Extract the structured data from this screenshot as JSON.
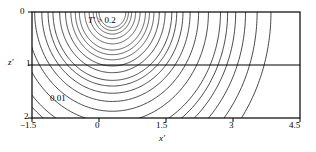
{
  "figure": {
    "kind": "contour-plot",
    "background": "#ffffff",
    "line_color": "#1a1a1a",
    "frame_color": "#000000"
  },
  "chart_data": {
    "type": "line",
    "title": "",
    "subtitle": "",
    "xlabel": "x'",
    "ylabel": "z'",
    "xlim": [
      -1.5,
      4.5
    ],
    "ylim": [
      0,
      2
    ],
    "y_axis_inverted": true,
    "grid": false,
    "legend": "none",
    "x_ticks": [
      -1.5,
      0,
      1.5,
      3,
      4.5
    ],
    "x_tick_labels": [
      "−1.5",
      "0",
      "1.5",
      "3",
      "4.5"
    ],
    "y_ticks": [
      0,
      1,
      2
    ],
    "y_tick_labels": [
      "0",
      "1",
      "2"
    ],
    "source_point": {
      "x": 0.3,
      "z": 0.0
    },
    "reference_line": {
      "orientation": "horizontal",
      "z": 1.0,
      "label": "z' = 1"
    },
    "contour_variable": "T'",
    "contour_levels": [
      0.2,
      0.18,
      0.16,
      0.14,
      0.12,
      0.1,
      0.09,
      0.08,
      0.07,
      0.06,
      0.05,
      0.045,
      0.04,
      0.035,
      0.03,
      0.025,
      0.02,
      0.018,
      0.016,
      0.014,
      0.012,
      0.01
    ],
    "labeled_contours": [
      {
        "level": 0.2,
        "label": "T' > 0.2",
        "note": "innermost white core region"
      },
      {
        "level": 0.01,
        "label": "0.01",
        "note": "outermost contour"
      }
    ],
    "contour_radii_x": [
      0.3,
      0.36,
      0.43,
      0.52,
      0.62,
      0.74,
      0.83,
      0.93,
      1.05,
      1.18,
      1.33,
      1.44,
      1.58,
      1.74,
      1.93,
      2.15,
      2.42,
      2.58,
      2.76,
      2.98,
      3.24,
      3.55
    ],
    "annotations": [
      {
        "id": "hot-core",
        "text_lead": "T",
        "text_rest": " > 0.2",
        "x": 0.75,
        "z": 0.12
      },
      {
        "id": "outer-level",
        "text": "0.01",
        "x": -0.6,
        "z": 1.6
      }
    ]
  },
  "axes": {
    "y_title_lead": "z",
    "y_title_prime": "′",
    "x_title_lead": "x",
    "x_title_prime": "′",
    "y_labels": [
      "0",
      "1",
      "2"
    ],
    "x_labels": [
      "−1.5",
      "0",
      "1.5",
      "3",
      "4.5"
    ]
  },
  "annotations": {
    "hot_core_lead": "T",
    "hot_core_prime": "′",
    "hot_core_rest": " > 0.2",
    "outer_level": "0.01"
  }
}
